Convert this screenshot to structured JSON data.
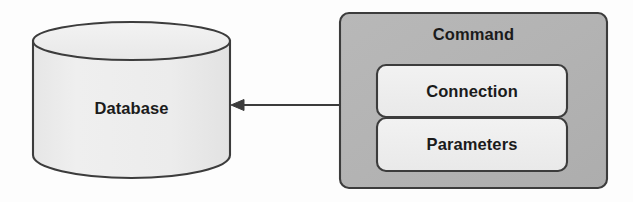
{
  "diagram": {
    "type": "component-diagram",
    "background_color": "#fdfdfd",
    "nodes": {
      "database": {
        "label": "Database",
        "shape": "cylinder",
        "fill_color": "#eeeeee",
        "stroke_color": "#3c3c3c"
      },
      "command": {
        "label": "Command",
        "shape": "rounded-rectangle",
        "fill_color": "#b4b4b4",
        "stroke_color": "#3c3c3c",
        "children": [
          {
            "key": "connection",
            "label": "Connection",
            "shape": "rounded-rectangle",
            "fill_color": "#efefef",
            "stroke_color": "#3c3c3c"
          },
          {
            "key": "parameters",
            "label": "Parameters",
            "shape": "rounded-rectangle",
            "fill_color": "#efefef",
            "stroke_color": "#3c3c3c"
          }
        ]
      }
    },
    "edges": [
      {
        "key": "command-to-database",
        "from": "command",
        "to": "database",
        "direction": "left",
        "style": "solid",
        "arrowhead": "filled-triangle",
        "color": "#3c3c3c",
        "label": ""
      }
    ]
  }
}
